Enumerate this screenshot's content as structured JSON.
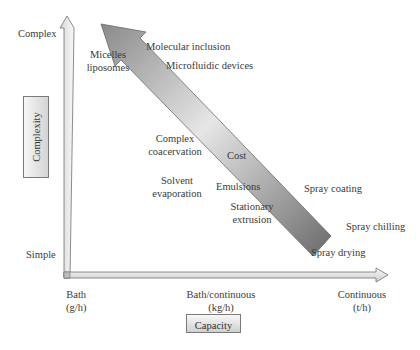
{
  "diagram": {
    "y_axis": {
      "title": "Complexity",
      "top_label": "Complex",
      "bottom_label": "Simple"
    },
    "x_axis": {
      "title": "Capacity",
      "ticks": [
        {
          "line1": "Bath",
          "line2": "(g/h)"
        },
        {
          "line1": "Bath/continuous",
          "line2": "(kg/h)"
        },
        {
          "line1": "Continuous",
          "line2": "(t/h)"
        }
      ]
    },
    "cost_arrow": {
      "label": "Cost"
    },
    "techniques": {
      "micelles": {
        "line1": "Micelles",
        "line2": "liposomes"
      },
      "molecular_inclusion": "Molecular inclusion",
      "microfluidic_devices": "Microfluidic devices",
      "complex_coacervation": {
        "line1": "Complex",
        "line2": "coacervation"
      },
      "solvent_evaporation": {
        "line1": "Solvent",
        "line2": "evaporation"
      },
      "emulsions": "Emulsions",
      "stationary_extrusion": {
        "line1": "Stationary",
        "line2": "extrusion"
      },
      "spray_coating": "Spray coating",
      "spray_chilling": "Spray chilling",
      "spray_drying": "Spray drying"
    },
    "colors": {
      "arrow_dark": "#7a7a7a",
      "arrow_light": "#e8e8e8",
      "outline": "#6e6e6e",
      "text": "#3a3a3a"
    }
  }
}
